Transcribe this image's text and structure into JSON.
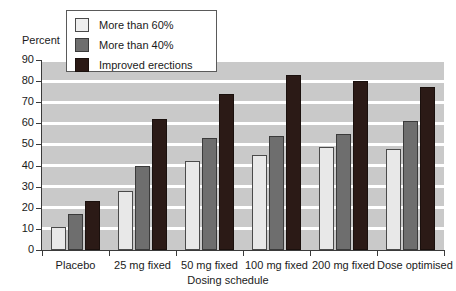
{
  "chart_data": {
    "type": "bar",
    "title": "",
    "xlabel": "Dosing schedule",
    "ylabel": "Percent",
    "ylim": [
      0,
      90
    ],
    "ytick_step": 10,
    "yticks": [
      0,
      10,
      20,
      30,
      40,
      50,
      60,
      70,
      80,
      90
    ],
    "grid": true,
    "grid_orientation": "horizontal",
    "legend_position": "top-left-inside",
    "categories": [
      "Placebo",
      "25 mg fixed",
      "50 mg fixed",
      "100 mg fixed",
      "200 mg fixed",
      "Dose optimised"
    ],
    "series": [
      {
        "name": "More than 60%",
        "color": "#e8e8e8",
        "values": [
          11,
          28,
          42,
          45,
          49,
          48
        ]
      },
      {
        "name": "More than 40%",
        "color": "#6e6e6e",
        "values": [
          17,
          40,
          53,
          54,
          55,
          61
        ]
      },
      {
        "name": "Improved erections",
        "color": "#2b1a16",
        "values": [
          23,
          62,
          74,
          83,
          80,
          77
        ]
      }
    ]
  },
  "axes": {
    "y_axis_title": "Percent",
    "x_axis_title": "Dosing schedule",
    "y_tick_labels": [
      "90",
      "80",
      "70",
      "60",
      "50",
      "40",
      "30",
      "20",
      "10",
      "0"
    ],
    "x_tick_labels": [
      "Placebo",
      "25 mg fixed",
      "50 mg fixed",
      "100 mg fixed",
      "200 mg fixed",
      "Dose optimised"
    ]
  },
  "legend": {
    "entries": [
      {
        "label": "More than 60%",
        "swatch": "light-gray-swatch"
      },
      {
        "label": "More than 40%",
        "swatch": "medium-gray-swatch"
      },
      {
        "label": "Improved erections",
        "swatch": "dark-brown-swatch"
      }
    ]
  },
  "colors": {
    "plot_background": "#c9c9c9",
    "gridline": "#ffffff",
    "axis": "#3a3a3a",
    "series_light": "#e8e8e8",
    "series_medium": "#6e6e6e",
    "series_dark": "#2b1a16"
  }
}
